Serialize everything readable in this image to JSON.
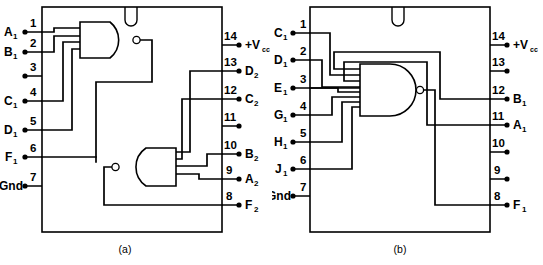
{
  "figure": {
    "background_color": "#ffffff",
    "line_color": "#000000",
    "panels": [
      {
        "id": "a",
        "caption": "(a)",
        "package": {
          "pin_count": 14,
          "notch": "top-center-u-notch"
        },
        "gates": [
          {
            "name": "upper-nand-gate",
            "type": "NAND",
            "inputs": 4,
            "orientation": "output-right",
            "bubble": true
          },
          {
            "name": "lower-nand-gate",
            "type": "NAND",
            "inputs": 4,
            "orientation": "output-left",
            "bubble": true
          }
        ],
        "left_pins": [
          {
            "num": "1",
            "label": "A",
            "sub": "1"
          },
          {
            "num": "2",
            "label": "B",
            "sub": "1"
          },
          {
            "num": "3",
            "label": "",
            "sub": ""
          },
          {
            "num": "4",
            "label": "C",
            "sub": "1"
          },
          {
            "num": "5",
            "label": "D",
            "sub": "1"
          },
          {
            "num": "6",
            "label": "F",
            "sub": "1"
          },
          {
            "num": "7",
            "label": "Gnd",
            "sub": ""
          }
        ],
        "right_pins": [
          {
            "num": "14",
            "label": "+V",
            "sub": "cc"
          },
          {
            "num": "13",
            "label": "D",
            "sub": "2"
          },
          {
            "num": "12",
            "label": "C",
            "sub": "2"
          },
          {
            "num": "11",
            "label": "",
            "sub": ""
          },
          {
            "num": "10",
            "label": "B",
            "sub": "2"
          },
          {
            "num": "9",
            "label": "A",
            "sub": "2"
          },
          {
            "num": "8",
            "label": "F",
            "sub": "2"
          }
        ]
      },
      {
        "id": "b",
        "caption": "(b)",
        "package": {
          "pin_count": 14,
          "notch": "top-center-u-notch"
        },
        "gates": [
          {
            "name": "eight-input-nand-gate",
            "type": "NAND",
            "inputs": 8,
            "orientation": "output-right",
            "bubble": true
          }
        ],
        "left_pins": [
          {
            "num": "1",
            "label": "C",
            "sub": "1"
          },
          {
            "num": "2",
            "label": "D",
            "sub": "1"
          },
          {
            "num": "3",
            "label": "E",
            "sub": "1"
          },
          {
            "num": "4",
            "label": "G",
            "sub": "1"
          },
          {
            "num": "5",
            "label": "H",
            "sub": "1"
          },
          {
            "num": "6",
            "label": "J",
            "sub": "1"
          },
          {
            "num": "7",
            "label": "Gnd",
            "sub": ""
          }
        ],
        "right_pins": [
          {
            "num": "14",
            "label": "+V",
            "sub": "cc"
          },
          {
            "num": "13",
            "label": "",
            "sub": ""
          },
          {
            "num": "12",
            "label": "B",
            "sub": "1"
          },
          {
            "num": "11",
            "label": "A",
            "sub": "1"
          },
          {
            "num": "10",
            "label": "",
            "sub": ""
          },
          {
            "num": "9",
            "label": "",
            "sub": ""
          },
          {
            "num": "8",
            "label": "F",
            "sub": "1"
          }
        ]
      }
    ]
  }
}
